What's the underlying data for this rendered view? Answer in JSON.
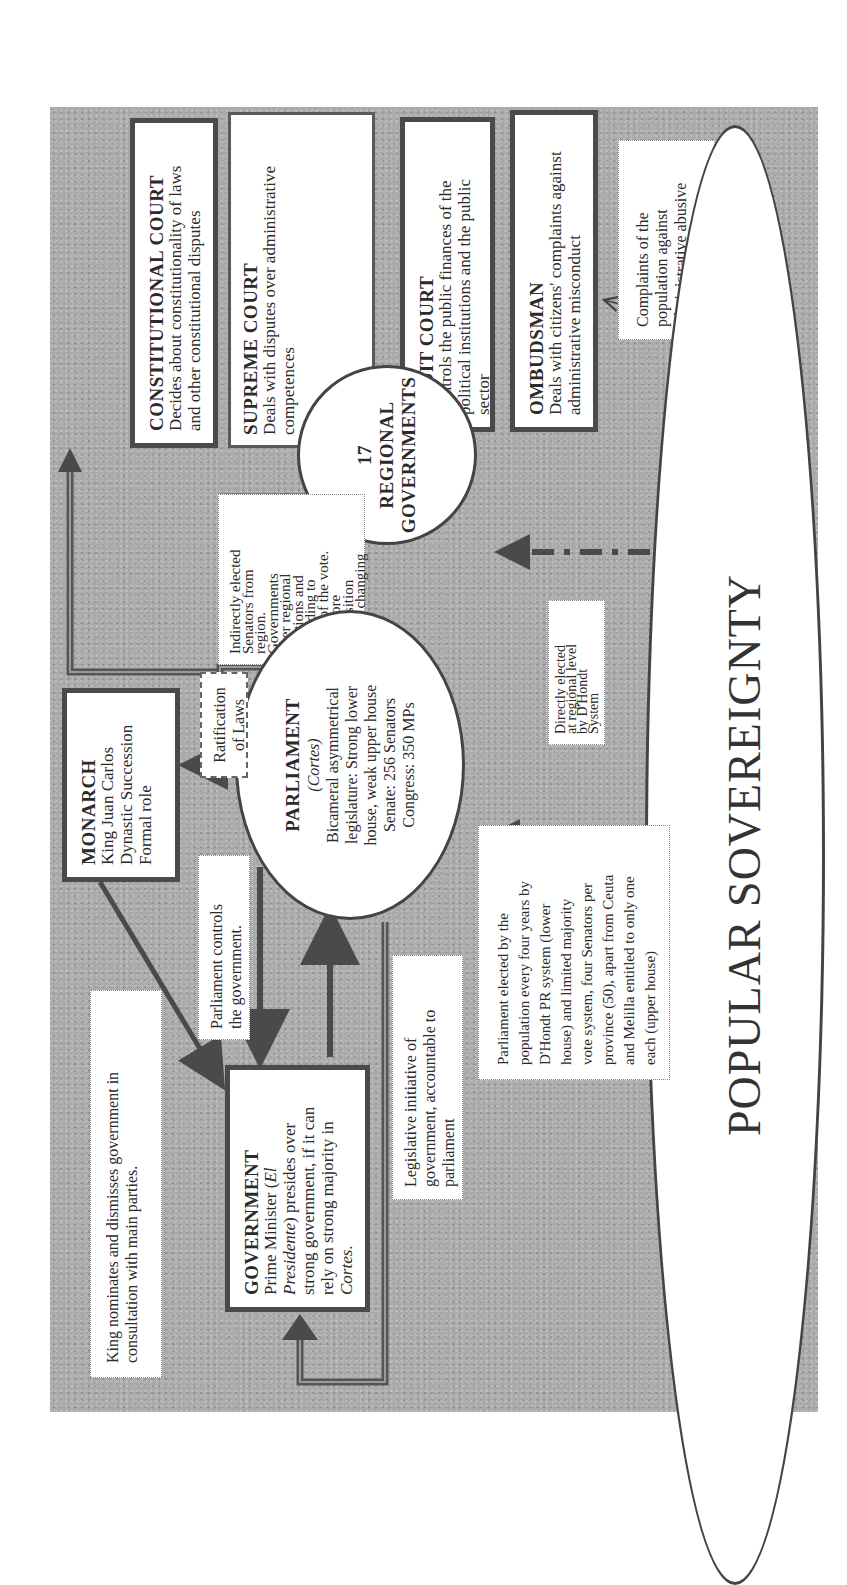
{
  "diagram": {
    "orientation": "rotated 90 degrees counter-clockwise",
    "colors": {
      "background_texture": "#a9a9a9",
      "box_fill": "#ffffff",
      "border": "#4a4a4a",
      "arrow": "#4a4a4a"
    },
    "nodes": {
      "constitutional_court": {
        "title": "CONSTITUTIONAL COURT",
        "lines": [
          "Decides about constitutionality of laws",
          "and other constitutional disputes"
        ]
      },
      "supreme_court": {
        "title": "SUPREME COURT",
        "lines": [
          "Deals with disputes over administrative",
          "competences"
        ]
      },
      "audit_court": {
        "title": "AUDIT COURT",
        "lines": [
          "Controls the public finances of the",
          "political institutions and the public",
          "sector"
        ]
      },
      "ombudsman": {
        "title": "OMBUDSMAN",
        "lines": [
          "Deals with citizens' complaints against",
          "administrative misconduct"
        ]
      },
      "regional_governments": {
        "lines": [
          "17",
          "REGIONAL",
          "GOVERNMENTS"
        ]
      },
      "parliament": {
        "title": "PARLIAMENT",
        "subtitle": "(Cortes)",
        "lines": [
          "Bicameral asymmetrical",
          "legislature: Strong lower",
          "house, weak upper house",
          "Senate: 256 Senators",
          "Congress: 350 MPs"
        ]
      },
      "monarch": {
        "title": "MONARCH",
        "lines": [
          "King Juan Carlos",
          "Dynastic Succession",
          "Formal role"
        ]
      },
      "government": {
        "title": "GOVERNMENT",
        "line1_pre": "Prime Minister (",
        "line1_italic": "El",
        "line2_italic": "Presidente",
        "line2_post": ") presides over",
        "line3": "strong government, if it can",
        "line4": "rely on strong majority in",
        "line5_italic": "Cortes",
        "line5_post": "."
      },
      "popular_sovereignty": {
        "title": "POPULAR SOVEREIGNTY"
      }
    },
    "notes": {
      "complaints": [
        "Complaints of the",
        "population against",
        "administrative abusive",
        "behavior"
      ],
      "indirectly_elected": [
        "Indirectly elected",
        "Senators from",
        "region.",
        "Governments",
        "after regional",
        "elections and",
        "according to",
        "share of the vote.",
        "Therefore",
        "composition",
        "always changing"
      ],
      "ratification": [
        "Ratification",
        "of Laws"
      ],
      "parliament_controls": [
        "Parliament controls",
        "the government."
      ],
      "legislative_initiative": [
        "Legislative initiative of",
        "government, accountable to",
        "parliament"
      ],
      "king_nominates": [
        "King nominates and dismisses government in",
        "consultation with main parties."
      ],
      "directly_elected": [
        "Directly elected",
        "at regional level",
        "by D'Hondt",
        "System"
      ],
      "parliament_elected": [
        "Parliament elected by the",
        "population every four years by",
        "D'Hondt PR system (lower",
        "house) and limited majority",
        "vote system, four Senators per",
        "province (50), apart from Ceuta",
        "and Melilla entitled to only one",
        "each (upper house)"
      ]
    },
    "edges": [
      {
        "from": "parliament/regional_governments",
        "to": "constitutional_court",
        "style": "double-line"
      },
      {
        "from": "supreme_court",
        "to": "audit_court",
        "style": "double-line connector"
      },
      {
        "from": "regional_governments",
        "to": "parliament",
        "style": "solid"
      },
      {
        "from": "popular_sovereignty",
        "to": "regional_governments",
        "style": "dash-dot"
      },
      {
        "from": "popular_sovereignty",
        "to": "parliament",
        "style": "dash-dot"
      },
      {
        "from": "popular_sovereignty",
        "to": "ombudsman",
        "style": "thin"
      },
      {
        "from": "parliament",
        "to": "monarch",
        "style": "solid",
        "label": "Ratification of Laws"
      },
      {
        "from": "monarch",
        "to": "government",
        "style": "solid",
        "label": "King nominates and dismisses government"
      },
      {
        "from": "parliament",
        "to": "government",
        "style": "solid",
        "label": "Parliament controls the government."
      },
      {
        "from": "government",
        "to": "parliament",
        "style": "solid",
        "label": "Legislative initiative"
      },
      {
        "from": "parliament",
        "to": "government",
        "style": "double-line loop"
      }
    ]
  }
}
